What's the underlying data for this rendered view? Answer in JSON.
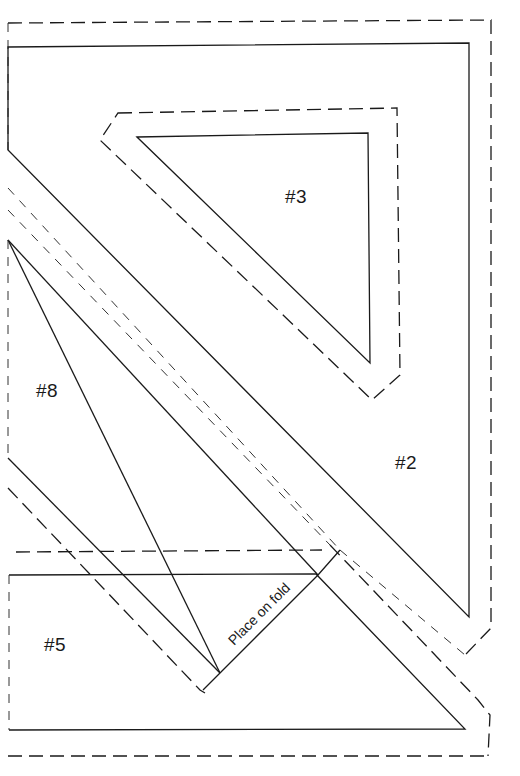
{
  "diagram": {
    "type": "sewing-pattern",
    "pieces": [
      {
        "id": "piece-2",
        "label": "#2"
      },
      {
        "id": "piece-3",
        "label": "#3"
      },
      {
        "id": "piece-5",
        "label": "#5"
      },
      {
        "id": "piece-8",
        "label": "#8"
      }
    ],
    "annotations": {
      "fold_label": "Place on fold"
    },
    "legend": {
      "solid_line": "cutting/stitching line",
      "dashed_line": "seam allowance"
    },
    "colors": {
      "line": "#1a1a1a",
      "background": "#ffffff"
    }
  }
}
